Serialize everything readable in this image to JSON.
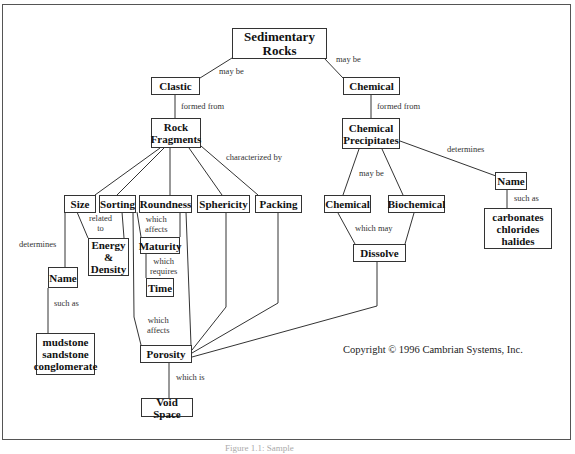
{
  "diagram": {
    "type": "concept-map",
    "nodes": {
      "sedimentary_rocks": "Sedimentary\nRocks",
      "clastic": "Clastic",
      "chemical_top": "Chemical",
      "rock_fragments": "Rock\nFragments",
      "chemical_precipitates": "Chemical\nPrecipitates",
      "size": "Size",
      "sorting": "Sorting",
      "roundness": "Roundness",
      "sphericity": "Sphericity",
      "packing": "Packing",
      "chemical_lower": "Chemical",
      "biochemical": "Biochemical",
      "name_right": "Name",
      "carbonates": "carbonates\nchlorides\nhalides",
      "energy_density": "Energy\n&\nDensity",
      "maturity": "Maturity",
      "time": "Time",
      "name_left": "Name",
      "rock_names": "mudstone\nsandstone\nconglomerate",
      "dissolve": "Dissolve",
      "porosity": "Porosity",
      "void_space": "Void Space"
    },
    "links": {
      "may_be_left": "may be",
      "may_be_right": "may be",
      "formed_from_left": "formed from",
      "formed_from_right": "formed from",
      "characterized_by": "characterized by",
      "determines_right": "determines",
      "may_be_chem": "may be",
      "such_as_right": "such as",
      "which_may": "which may",
      "related_to": "related\nto",
      "determines_left": "determines",
      "which_affects_1": "which\naffects",
      "which_requires": "which\nrequires",
      "which_affects_2": "which\naffects",
      "such_as_left": "such as",
      "which_is": "which is"
    },
    "copyright": "Copyright © 1996 Cambrian Systems, Inc.",
    "caption": "Figure 1.1: Sample"
  }
}
